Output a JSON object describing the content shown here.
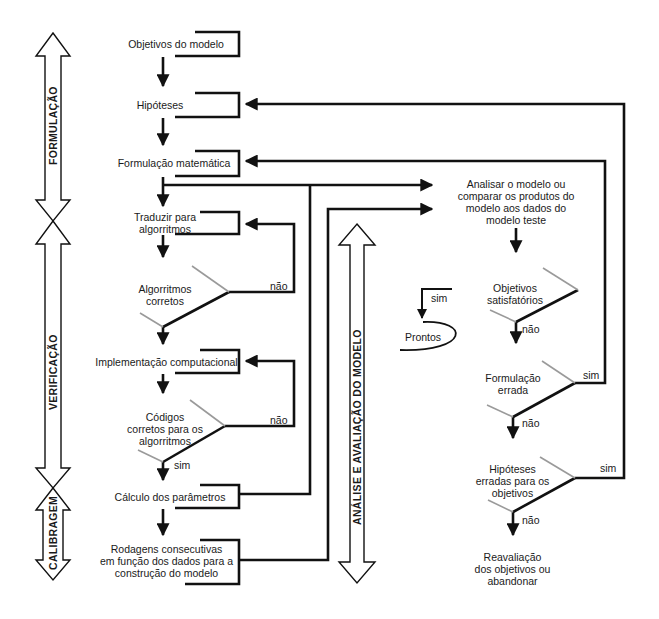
{
  "phases": {
    "formulacao": "FORMULAÇÃO",
    "verificacao": "VERIFICAÇÃO",
    "calibragem": "CALIBRAGEM",
    "analise": "ANÁLISE E AVALIAÇÃO DO MODELO"
  },
  "steps": {
    "objetivos": "Objetivos do modelo",
    "hipoteses": "Hipóteses",
    "formulacao_matematica": "Formulação matemática",
    "traduzir_1": "Traduzir para",
    "traduzir_2": "algorritmos",
    "implementacao": "Implementação computacional",
    "calculo": "Cálculo dos parâmetros",
    "rodagens_1": "Rodagens consecutivas",
    "rodagens_2": "em função dos dados para a",
    "rodagens_3": "construção do modelo",
    "analisar_1": "Analisar o modelo ou",
    "analisar_2": "comparar os produtos do",
    "analisar_3": "modelo aos dados do",
    "analisar_4": "modelo teste",
    "prontos": "Prontos",
    "reavaliacao_1": "Reavaliação",
    "reavaliacao_2": "dos objetivos ou",
    "reavaliacao_3": "abandonar"
  },
  "decisions": {
    "algoritmos_1": "Algorritmos",
    "algoritmos_2": "corretos",
    "codigos_1": "Códigos",
    "codigos_2": "corretos para os",
    "codigos_3": "algorritmos",
    "objetivos_sat_1": "Objetivos",
    "objetivos_sat_2": "satisfatórios",
    "formulacao_errada_1": "Formulação",
    "formulacao_errada_2": "errada",
    "hipoteses_erradas_1": "Hipóteses",
    "hipoteses_erradas_2": "erradas para os",
    "hipoteses_erradas_3": "objetivos"
  },
  "edge_labels": {
    "algoritmos_nao": "não",
    "codigos_nao": "não",
    "codigos_sim": "sim",
    "objetivos_sim": "sim",
    "objetivos_nao": "não",
    "formulacao_sim": "sim",
    "formulacao_nao": "não",
    "hipoteses_sim": "sim",
    "hipoteses_nao": "não"
  },
  "colors": {
    "line": "#111111",
    "faded": "#9a9a9a",
    "background": "#ffffff"
  }
}
